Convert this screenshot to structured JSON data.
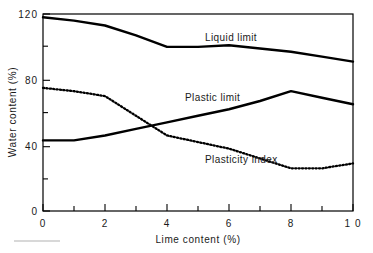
{
  "chart_data": {
    "type": "line",
    "title": "",
    "xlabel": "Lime content (%)",
    "ylabel": "Water content (%)",
    "xlim": [
      0,
      10
    ],
    "ylim": [
      0,
      120
    ],
    "grid": false,
    "legend_position": "inline-annotations",
    "x_ticks_major": [
      0,
      2,
      4,
      6,
      8,
      10
    ],
    "x_tick_labels": [
      "0",
      "2",
      "4",
      "6",
      "8",
      "1 0"
    ],
    "x_ticks_minor": [
      1,
      3,
      5,
      7,
      9
    ],
    "y_ticks_major": [
      0,
      40,
      80,
      120
    ],
    "y_tick_labels": [
      "0",
      "40",
      "80",
      "120"
    ],
    "y_ticks_minor": [
      20,
      60,
      100
    ],
    "series": [
      {
        "name": "Liquid limit",
        "style": "solid",
        "color": "#000000",
        "x": [
          0,
          1,
          2,
          3,
          4,
          5,
          6,
          7,
          8,
          9,
          10
        ],
        "values": [
          118,
          116,
          113,
          107,
          100,
          100,
          101,
          99,
          97,
          94,
          91
        ]
      },
      {
        "name": "Plastic limit",
        "style": "solid",
        "color": "#000000",
        "x": [
          0,
          1,
          2,
          3,
          4,
          5,
          6,
          7,
          8,
          9,
          10
        ],
        "values": [
          43,
          43,
          46,
          50,
          54,
          58,
          62,
          67,
          73,
          69,
          65
        ]
      },
      {
        "name": "Plasticity index",
        "style": "dotted",
        "color": "#000000",
        "x": [
          0,
          1,
          2,
          3,
          4,
          5,
          6,
          7,
          8,
          9,
          10
        ],
        "values": [
          75,
          73,
          70,
          58,
          46,
          42,
          38,
          32,
          26,
          26,
          29
        ]
      }
    ],
    "annotations": [
      {
        "text": "Liquid  limit",
        "x": 6.0,
        "y": 108
      },
      {
        "text": "Plastic  limit",
        "x": 5.1,
        "y": 72
      },
      {
        "text": "Plasticity  index",
        "x": 6.4,
        "y": 35
      }
    ]
  }
}
